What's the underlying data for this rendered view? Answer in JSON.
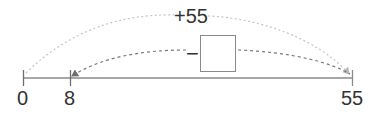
{
  "number_line": {
    "start": 0,
    "end": 55,
    "tick_labels": [
      "0",
      "8",
      "55"
    ],
    "line_color": "#8a8a8a"
  },
  "arcs": {
    "top": {
      "label": "+55",
      "from": "0",
      "to": "55",
      "color": "#bdbdbd",
      "style": "dotted"
    },
    "bottom": {
      "operator": "−",
      "from": "55",
      "to": "8",
      "color": "#6e6e6e",
      "style": "dashed",
      "blank_box": ""
    }
  }
}
